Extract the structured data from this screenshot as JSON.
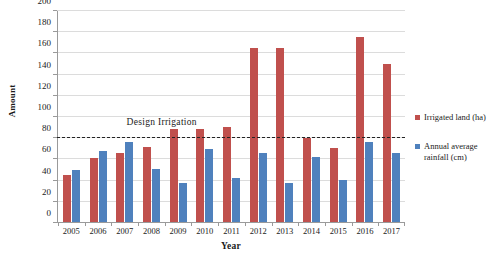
{
  "chart_data": {
    "type": "bar",
    "title": "",
    "xlabel": "Year",
    "ylabel": "Amount",
    "categories": [
      "2005",
      "2006",
      "2007",
      "2008",
      "2009",
      "2010",
      "2011",
      "2012",
      "2013",
      "2014",
      "2015",
      "2016",
      "2017"
    ],
    "series": [
      {
        "name": "Irrigated land (ha)",
        "color": "#C0504D",
        "values": [
          45,
          61,
          65,
          71,
          88,
          88,
          90,
          165,
          165,
          80,
          70,
          175,
          150
        ]
      },
      {
        "name": "Annual average rainfall (cm)",
        "color": "#4F81BD",
        "values": [
          49,
          67,
          76,
          50,
          37,
          69,
          42,
          65,
          37,
          62,
          40,
          76,
          65
        ]
      }
    ],
    "ylim": [
      0,
      200
    ],
    "ytick_step": 20,
    "yticks": [
      "0",
      "20",
      "40",
      "60",
      "80",
      "100",
      "120",
      "140",
      "160",
      "180",
      "200"
    ],
    "grid": true,
    "legend_position": "right",
    "annotations": [
      {
        "label": "Design Irrigation",
        "value": 80,
        "style": "dashed-horizontal-line",
        "color": "#222222"
      }
    ]
  }
}
